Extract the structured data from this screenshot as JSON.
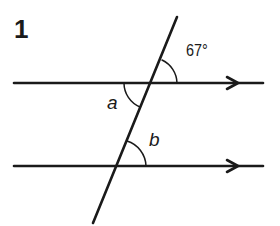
{
  "problem": {
    "number": "1"
  },
  "diagram": {
    "given_angle": "67°",
    "angle_a_label": "a",
    "angle_b_label": "b",
    "line_color": "#1a1a1a",
    "background": "#ffffff"
  }
}
